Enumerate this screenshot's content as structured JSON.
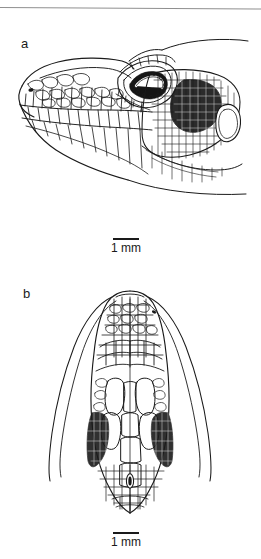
{
  "plate": {
    "background_color": "#ffffff",
    "ink_color": "#1a1a1a",
    "width_px": 261,
    "height_px": 559,
    "top_rule_color": "#8f8f8f"
  },
  "panels": [
    {
      "label": "a",
      "view": "lateral head view",
      "scalebar": {
        "line_label": "1 mm",
        "length_mm": 1
      }
    },
    {
      "label": "b",
      "view": "dorsal head view",
      "scalebar": {
        "line_label": "1 mm",
        "length_mm": 1
      }
    }
  ],
  "figure_a": {
    "label": "a",
    "features": {
      "eye": "orbit with dark pigmented palpebral scales",
      "ear": "oval tympanic opening",
      "nostril": "small dark nostril on snout",
      "scalation": "labial plates, granular temporal scales, dark nuchal patch"
    }
  },
  "figure_b": {
    "label": "b",
    "features": {
      "parietal_eye": "small dark parietal eye spot on midline",
      "scalation": "polygonal head shields, elongate supraocular and parietal plates, granular lateral scales"
    }
  }
}
